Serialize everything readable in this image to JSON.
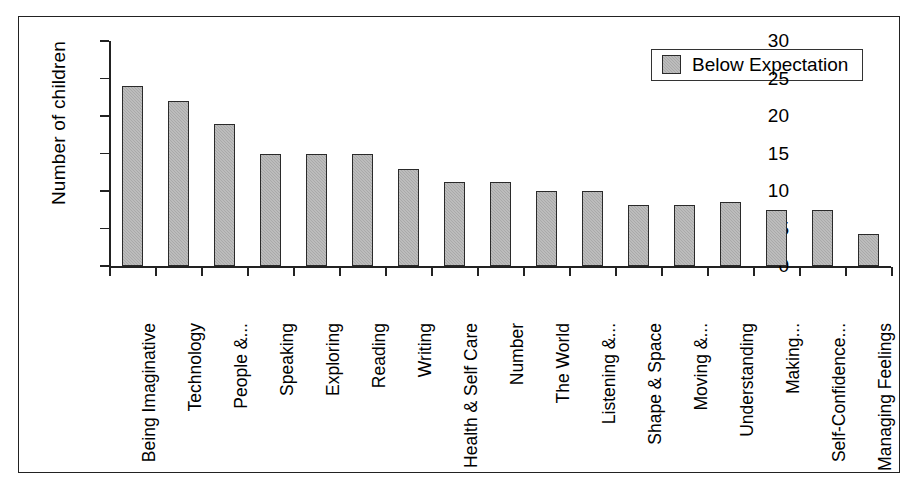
{
  "chart_data": {
    "type": "bar",
    "title": "",
    "xlabel": "",
    "ylabel": "Number of children",
    "ylim": [
      0,
      30
    ],
    "yticks": [
      0,
      5,
      10,
      15,
      20,
      25,
      30
    ],
    "grid": false,
    "legend": {
      "position": "top-right",
      "entries": [
        {
          "name": "Below Expectation",
          "color": "#a9a9a9"
        }
      ]
    },
    "categories": [
      "Being Imaginative",
      "Technology",
      "People &...",
      "Speaking",
      "Exploring",
      "Reading",
      "Writing",
      "Health & Self Care",
      "Number",
      "The World",
      "Listening &...",
      "Shape & Space",
      "Moving &...",
      "Understanding",
      "Making...",
      "Self-Confidence...",
      "Managing Feelings"
    ],
    "series": [
      {
        "name": "Below Expectation",
        "values": [
          24,
          22,
          19,
          15,
          15,
          15,
          13,
          11.2,
          11.2,
          10,
          10,
          8.1,
          8.1,
          8.5,
          7.5,
          7.5,
          4.3
        ]
      }
    ]
  },
  "colors": {
    "bar_fill": "#a9a9a9",
    "bar_stroke": "#2a2a2a",
    "axis": "#222222",
    "frame": "#222222",
    "background": "#ffffff"
  }
}
